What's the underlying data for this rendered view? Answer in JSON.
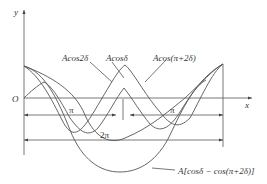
{
  "diagram": {
    "axis_labels": {
      "y": "y",
      "x": "x",
      "origin": "O"
    },
    "curve_labels": {
      "cos2d": "Acos2δ",
      "cosd": "Acosδ",
      "cos_pi_2d": "Acos(π+2δ)",
      "sum": "A[cosδ − cos(π+2δ)]"
    },
    "dimension_labels": {
      "pi_left": "π",
      "pi_right": "π",
      "two_pi": "2π"
    }
  }
}
